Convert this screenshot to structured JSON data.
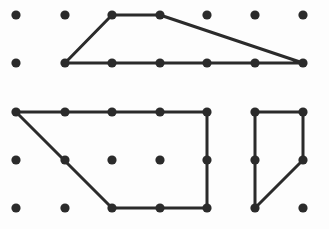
{
  "figure": {
    "width": 329,
    "height": 229,
    "background_color": "#fdfdfd",
    "dot_color": "#2b2b2b",
    "line_color": "#2b2b2b",
    "dot_radius": 4.6,
    "line_width": 3
  },
  "lattice": {
    "name": "dot-grid",
    "columns_x": [
      16,
      65,
      112,
      160,
      207,
      255,
      303
    ],
    "rows_y": [
      15,
      63,
      112,
      160,
      208
    ],
    "column_spacing": 48,
    "row_spacing": 48,
    "dots": [
      {
        "x": 16,
        "y": 15
      },
      {
        "x": 65,
        "y": 15
      },
      {
        "x": 112,
        "y": 15
      },
      {
        "x": 160,
        "y": 15
      },
      {
        "x": 207,
        "y": 15
      },
      {
        "x": 255,
        "y": 15
      },
      {
        "x": 303,
        "y": 15
      },
      {
        "x": 16,
        "y": 63
      },
      {
        "x": 65,
        "y": 63
      },
      {
        "x": 112,
        "y": 63
      },
      {
        "x": 160,
        "y": 63
      },
      {
        "x": 207,
        "y": 63
      },
      {
        "x": 255,
        "y": 63
      },
      {
        "x": 303,
        "y": 63
      },
      {
        "x": 16,
        "y": 112
      },
      {
        "x": 65,
        "y": 112
      },
      {
        "x": 112,
        "y": 112
      },
      {
        "x": 160,
        "y": 112
      },
      {
        "x": 207,
        "y": 112
      },
      {
        "x": 255,
        "y": 112
      },
      {
        "x": 303,
        "y": 112
      },
      {
        "x": 16,
        "y": 160
      },
      {
        "x": 65,
        "y": 160
      },
      {
        "x": 112,
        "y": 160
      },
      {
        "x": 160,
        "y": 160
      },
      {
        "x": 207,
        "y": 160
      },
      {
        "x": 255,
        "y": 160
      },
      {
        "x": 303,
        "y": 160
      },
      {
        "x": 16,
        "y": 208
      },
      {
        "x": 65,
        "y": 208
      },
      {
        "x": 112,
        "y": 208
      },
      {
        "x": 160,
        "y": 208
      },
      {
        "x": 207,
        "y": 208
      },
      {
        "x": 255,
        "y": 208
      },
      {
        "x": 303,
        "y": 208
      }
    ]
  },
  "shapes": [
    {
      "name": "top-trapezoid",
      "label": "Trapezoid",
      "points": "65,63 112,15 160,15 303,63",
      "closed": true,
      "vertices": [
        {
          "x": 65,
          "y": 63
        },
        {
          "x": 112,
          "y": 15
        },
        {
          "x": 160,
          "y": 15
        },
        {
          "x": 303,
          "y": 63
        }
      ]
    },
    {
      "name": "bottom-left-trapezoid",
      "label": "Right trapezoid",
      "points": "16,112 207,112 207,208 112,208",
      "closed": true,
      "vertices": [
        {
          "x": 16,
          "y": 112
        },
        {
          "x": 207,
          "y": 112
        },
        {
          "x": 207,
          "y": 208
        },
        {
          "x": 112,
          "y": 208
        }
      ]
    },
    {
      "name": "bottom-right-trapezoid",
      "label": "Small trapezoid",
      "points": "255,112 303,112 303,160 255,208",
      "closed": true,
      "vertices": [
        {
          "x": 255,
          "y": 112
        },
        {
          "x": 303,
          "y": 112
        },
        {
          "x": 303,
          "y": 160
        },
        {
          "x": 255,
          "y": 208
        }
      ]
    }
  ]
}
